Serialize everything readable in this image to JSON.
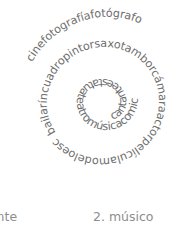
{
  "spiral": {
    "name": "word-spiral",
    "description": "Spanish vocabulary words arranged along an inward spiral",
    "text_color": "#6e6e6e",
    "words": [
      "cantante",
      "estatua",
      "teatro",
      "música",
      "comics",
      "caballa",
      "bailarín",
      "cuadro",
      "pintor",
      "saxo",
      "tambor",
      "cámara",
      "actor",
      "película",
      "modelo",
      "escultor",
      "pintura",
      "cine",
      "fotografía",
      "fotógrafo"
    ],
    "full_string": "cantanteestatuateatromúsicacomicscaballarínbailarín cuadropintorsaxotamborcámaraactorpelículamodeloescultorpinturacinefotografíafotógrafo",
    "inner_segment": "cantanteestatuateatromúsicacomicscaballa",
    "mid_segment": "bailaríncuadropintorsaxotamborcámaraactorpelículamodeloescultorpintura",
    "outer_segment": "cinefotografíafotógrafo"
  },
  "captions": {
    "left": {
      "label": "tante",
      "truncated": true
    },
    "right": {
      "number": "2.",
      "label": "músico",
      "full": "2. músico"
    },
    "color": "#8d8d8d"
  }
}
